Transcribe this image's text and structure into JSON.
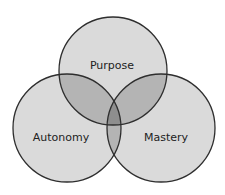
{
  "diagram": {
    "type": "venn",
    "sets": [
      {
        "label": "Purpose",
        "cx": 113,
        "cy": 71,
        "r": 54
      },
      {
        "label": "Autonomy",
        "cx": 67,
        "cy": 128,
        "r": 54
      },
      {
        "label": "Mastery",
        "cx": 161,
        "cy": 128,
        "r": 54
      }
    ],
    "colors": {
      "fill_single": "#dadada",
      "fill_double": "#b4b4b4",
      "fill_triple": "#8e8e8e",
      "stroke": "#2e2e2e"
    }
  }
}
